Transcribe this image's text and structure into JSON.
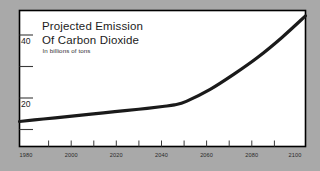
{
  "figure": {
    "background_color": "#a9a9a9",
    "panel_color": "#ffffff",
    "frame_color": "#000000",
    "line_color": "#1a1a1a"
  },
  "chart_data": {
    "type": "line",
    "title_line1": "Projected Emission",
    "title_line2": "Of Carbon Dioxide",
    "subtitle": "In billions of tons",
    "xlabel": "",
    "ylabel": "",
    "xlim": [
      1980,
      2100
    ],
    "ylim": [
      0,
      50
    ],
    "grid": false,
    "legend": "none",
    "x_tick_labels": [
      "1980",
      "2000",
      "2020",
      "2040",
      "2060",
      "2080",
      "2100"
    ],
    "x_tick_values": [
      1980,
      2000,
      2020,
      2040,
      2060,
      2080,
      2100
    ],
    "x_minor_tick_values": [
      1990,
      2010,
      2030,
      2050,
      2070,
      2090
    ],
    "y_tick_labels": [
      "20",
      "40"
    ],
    "y_tick_values": [
      20,
      40
    ],
    "y_minor_tick_values": [
      10,
      30
    ],
    "series": [
      {
        "name": "Projected CO2 emission",
        "x": [
          1980,
          1990,
          2000,
          2010,
          2020,
          2030,
          2040,
          2045,
          2050,
          2060,
          2070,
          2080,
          2090,
          2100
        ],
        "values": [
          9.2,
          10.1,
          11.0,
          11.9,
          12.8,
          13.7,
          14.7,
          15.3,
          16.6,
          21.0,
          26.6,
          32.8,
          40.0,
          48.0
        ]
      }
    ]
  }
}
